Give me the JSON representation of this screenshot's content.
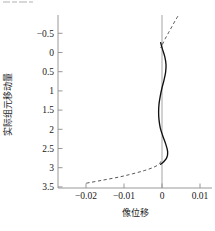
{
  "chart_data": {
    "type": "line",
    "title": "",
    "xlabel": "像位移",
    "ylabel": "实际组元移动量",
    "xlim": [
      -0.025,
      0.0125
    ],
    "ylim": [
      -0.75,
      3.62
    ],
    "y_inverted": true,
    "grid": false,
    "legend": "none",
    "xticks": [
      -0.02,
      -0.01,
      0,
      0.01
    ],
    "xticklabels": [
      "−0.02",
      "−0.01",
      "0",
      "0.01"
    ],
    "yticks": [
      -0.5,
      0,
      0.5,
      1,
      1.5,
      2,
      2.5,
      3,
      3.5
    ],
    "yticklabels": [
      "−0.5",
      "0",
      "0.5",
      "1",
      "1.5",
      "2",
      "2.5",
      "3",
      "3.5"
    ],
    "reference_lines": [
      {
        "name": "zero-vertical-line",
        "orientation": "vertical",
        "x": 0,
        "style": "solid",
        "color": "#9a9a9a"
      }
    ],
    "series": [
      {
        "name": "solid-curve",
        "style": "solid",
        "color": "#101010",
        "points": [
          {
            "y": -0.05,
            "x": 0.0
          },
          {
            "y": 0.1,
            "x": 0.0004
          },
          {
            "y": 0.3,
            "x": 0.001
          },
          {
            "y": 0.5,
            "x": 0.0013
          },
          {
            "y": 0.7,
            "x": 0.0012
          },
          {
            "y": 0.9,
            "x": 0.0008
          },
          {
            "y": 1.1,
            "x": 0.0003
          },
          {
            "y": 1.3,
            "x": -0.0001
          },
          {
            "y": 1.5,
            "x": -0.0004
          },
          {
            "y": 1.7,
            "x": -0.0005
          },
          {
            "y": 1.9,
            "x": -0.0004
          },
          {
            "y": 2.1,
            "x": -0.0001
          },
          {
            "y": 2.3,
            "x": 0.0005
          },
          {
            "y": 2.5,
            "x": 0.0012
          },
          {
            "y": 2.7,
            "x": 0.0017
          },
          {
            "y": 2.85,
            "x": 0.0015
          },
          {
            "y": 2.95,
            "x": 0.0008
          },
          {
            "y": 3.02,
            "x": 0.0
          }
        ]
      },
      {
        "name": "dashed-curve",
        "style": "dashed",
        "color": "#3a3a3a",
        "points": [
          {
            "y": -0.72,
            "x": 0.0042
          },
          {
            "y": -0.6,
            "x": 0.0035
          },
          {
            "y": -0.45,
            "x": 0.0027
          },
          {
            "y": -0.3,
            "x": 0.0019
          },
          {
            "y": -0.15,
            "x": 0.0011
          },
          {
            "y": 0.0,
            "x": 0.0004
          },
          {
            "y": 0.08,
            "x": 0.0
          },
          {
            "y": 2.95,
            "x": 0.0
          },
          {
            "y": 3.02,
            "x": -0.0004
          },
          {
            "y": 3.1,
            "x": -0.0018
          },
          {
            "y": 3.18,
            "x": -0.004
          },
          {
            "y": 3.26,
            "x": -0.0068
          },
          {
            "y": 3.34,
            "x": -0.01
          },
          {
            "y": 3.42,
            "x": -0.014
          },
          {
            "y": 3.5,
            "x": -0.0182
          }
        ]
      }
    ]
  },
  "figure": {
    "x_axis_title": "像位移",
    "y_axis_title": "实际组元移动量"
  }
}
